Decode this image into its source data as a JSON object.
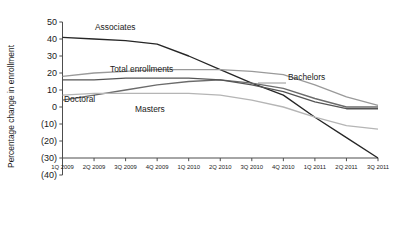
{
  "chart_data": {
    "type": "line",
    "title": "",
    "subtitle": "",
    "xlabel": "",
    "ylabel": "Percentage change in enrollment",
    "grid": false,
    "legend_position": "inline-labels",
    "x": [
      "1Q 2009",
      "2Q 2009",
      "3Q 2009",
      "4Q 2009",
      "1Q 2010",
      "2Q 2010",
      "3Q 2010",
      "4Q 2010",
      "1Q 2011",
      "2Q 2011",
      "3Q 2011"
    ],
    "xlim": [
      "1Q 2009",
      "3Q 2011"
    ],
    "ylim": [
      -40,
      50
    ],
    "ytick_labels": [
      "50",
      "40",
      "30",
      "20",
      "10",
      "0",
      "(10)",
      "(20)",
      "(30)",
      "(40)"
    ],
    "ytick_values": [
      50,
      40,
      30,
      20,
      10,
      0,
      -10,
      -20,
      -30,
      -40
    ],
    "series": [
      {
        "name": "Associates",
        "color": "#262626",
        "values": [
          41,
          40,
          39,
          37,
          30,
          22,
          14,
          7,
          -6,
          -18,
          -30
        ]
      },
      {
        "name": "Total enrollments",
        "color": "#9a9a9a",
        "values": [
          18,
          20,
          21,
          22,
          22,
          22,
          21,
          19,
          13,
          6,
          1
        ]
      },
      {
        "name": "Bachelors",
        "color": "#6b6b6b",
        "values": [
          4,
          7,
          10,
          13,
          15,
          16,
          14,
          11,
          5,
          0,
          0
        ]
      },
      {
        "name": "Doctoral",
        "color": "#555555",
        "values": [
          16,
          16,
          17,
          17,
          17,
          16,
          13,
          9,
          3,
          -1,
          -1
        ]
      },
      {
        "name": "Masters",
        "color": "#b5b5b5",
        "values": [
          7,
          8,
          8,
          8,
          8,
          7,
          4,
          0,
          -6,
          -11,
          -13
        ]
      }
    ],
    "series_label_positions": [
      {
        "name": "Associates",
        "x": 95,
        "y": 30,
        "anchor": "start",
        "leader": null
      },
      {
        "name": "Total enrollments",
        "x": 110,
        "y": 72,
        "anchor": "start",
        "leader": null
      },
      {
        "name": "Doctoral",
        "x": 64,
        "y": 102,
        "anchor": "start",
        "leader": null
      },
      {
        "name": "Masters",
        "x": 135,
        "y": 112,
        "anchor": "start",
        "leader": null
      },
      {
        "name": "Bachelors",
        "x": 288,
        "y": 80,
        "anchor": "start",
        "leader": {
          "x1": 286,
          "y1": 83,
          "x2": 258,
          "y2": 83
        }
      }
    ]
  }
}
